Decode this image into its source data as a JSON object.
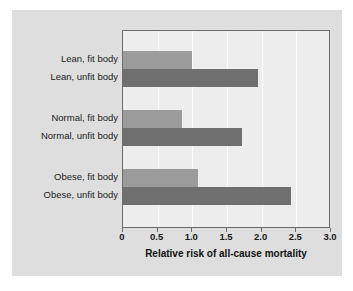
{
  "chart_data": {
    "type": "bar",
    "orientation": "horizontal",
    "title": "",
    "xlabel": "Relative risk of all-cause mortality",
    "ylabel": "",
    "xlim": [
      0,
      3.0
    ],
    "xticks": [
      "0",
      "0.5",
      "1.0",
      "1.5",
      "2.0",
      "2.5",
      "3.0"
    ],
    "xtick_values": [
      0,
      0.5,
      1.0,
      1.5,
      2.0,
      2.5,
      3.0
    ],
    "grid": true,
    "legend": "none",
    "groups": [
      {
        "name": "Lean",
        "bars": [
          {
            "label": "Lean, fit body",
            "value": 1.0,
            "series": "fit"
          },
          {
            "label": "Lean, unfit body",
            "value": 1.95,
            "series": "unfit"
          }
        ]
      },
      {
        "name": "Normal",
        "bars": [
          {
            "label": "Normal, fit body",
            "value": 0.85,
            "series": "fit"
          },
          {
            "label": "Normal, unfit body",
            "value": 1.72,
            "series": "unfit"
          }
        ]
      },
      {
        "name": "Obese",
        "bars": [
          {
            "label": "Obese, fit body",
            "value": 1.08,
            "series": "fit"
          },
          {
            "label": "Obese, unfit body",
            "value": 2.42,
            "series": "unfit"
          }
        ]
      }
    ],
    "categories": [
      "Lean, fit body",
      "Lean, unfit body",
      "Normal, fit body",
      "Normal, unfit body",
      "Obese, fit body",
      "Obese, unfit body"
    ],
    "values": [
      1.0,
      1.95,
      0.85,
      1.72,
      1.08,
      2.42
    ],
    "colors": {
      "fit": "#9b9b9b",
      "unfit": "#6f6f6f",
      "plot_background": "#ededed",
      "panel_background": "#dedede",
      "axis": "#6b6b6b",
      "gridline": "#fbfbfb",
      "text": "#1a1a1a"
    }
  },
  "labels": {
    "lean_fit": "Lean, fit body",
    "lean_unfit": "Lean, unfit body",
    "normal_fit": "Normal, fit body",
    "normal_unfit": "Normal, unfit body",
    "obese_fit": "Obese, fit body",
    "obese_unfit": "Obese, unfit body"
  },
  "ticks": {
    "t0": "0",
    "t1": "0.5",
    "t2": "1.0",
    "t3": "1.5",
    "t4": "2.0",
    "t5": "2.5",
    "t6": "3.0"
  },
  "axis_title": "Relative risk of all-cause mortality"
}
